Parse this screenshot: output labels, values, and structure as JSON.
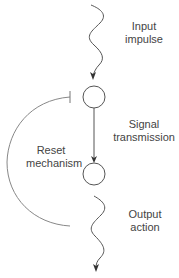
{
  "diagram": {
    "colors": {
      "stroke": "#555555",
      "arc": "#888888",
      "text": "#444444",
      "background": "#ffffff"
    },
    "nodes": [
      {
        "id": "node-1",
        "shape": "circle"
      },
      {
        "id": "node-2",
        "shape": "circle"
      }
    ],
    "edges": [
      {
        "from": "external",
        "to": "node-1",
        "style": "wavy-arrow"
      },
      {
        "from": "node-1",
        "to": "node-2",
        "style": "straight-arrow"
      },
      {
        "from": "node-2",
        "to": "external",
        "style": "wavy-arrow"
      },
      {
        "from": "node-2",
        "to": "node-1",
        "style": "curved-inhibitory-T-bar"
      }
    ],
    "labels": {
      "input": {
        "line1": "Input",
        "line2": "impulse"
      },
      "signal": {
        "line1": "Signal",
        "line2": "transmission"
      },
      "reset": {
        "line1": "Reset",
        "line2": "mechanism"
      },
      "output": {
        "line1": "Output",
        "line2": "action"
      }
    }
  }
}
